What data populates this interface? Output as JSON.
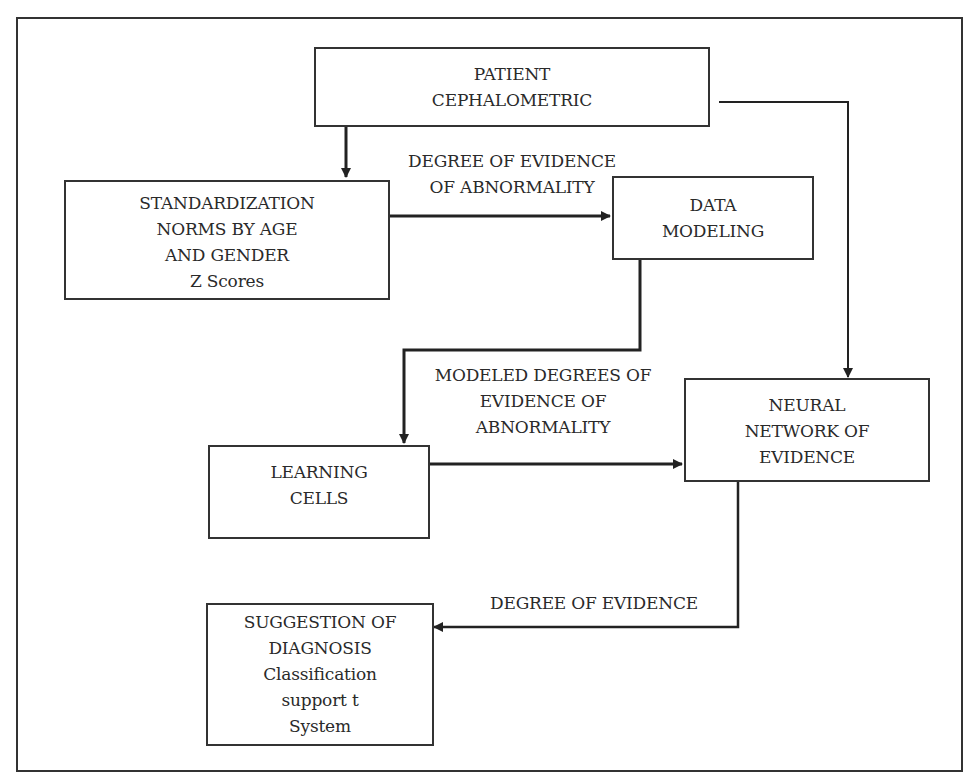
{
  "diagram": {
    "nodes": {
      "patient": {
        "lines": [
          "PATIENT",
          "CEPHALOMETRIC"
        ]
      },
      "standardization": {
        "lines": [
          "STANDARDIZATION",
          "NORMS BY AGE",
          "AND GENDER",
          "Z Scores"
        ]
      },
      "data_modeling": {
        "lines": [
          "DATA",
          "MODELING"
        ]
      },
      "learning_cells": {
        "lines": [
          "LEARNING",
          "CELLS"
        ]
      },
      "neural_network": {
        "lines": [
          "NEURAL",
          "NETWORK OF",
          "EVIDENCE"
        ]
      },
      "suggestion": {
        "lines": [
          "SUGGESTION OF",
          "DIAGNOSIS",
          "Classification",
          "support t",
          "System"
        ]
      }
    },
    "edge_labels": {
      "degree_abnormality": {
        "lines": [
          "DEGREE OF EVIDENCE",
          "OF ABNORMALITY"
        ]
      },
      "modeled_degrees": {
        "lines": [
          "MODELED DEGREES OF",
          "EVIDENCE  OF",
          "ABNORMALITY"
        ]
      },
      "degree_evidence": {
        "lines": [
          "DEGREE OF EVIDENCE"
        ]
      }
    },
    "edges": [
      {
        "from": "patient",
        "to": "standardization",
        "label": ""
      },
      {
        "from": "standardization",
        "to": "data_modeling",
        "label": "DEGREE OF EVIDENCE OF ABNORMALITY"
      },
      {
        "from": "patient",
        "to": "neural_network",
        "label": ""
      },
      {
        "from": "data_modeling",
        "to": "learning_cells",
        "label": "MODELED DEGREES OF EVIDENCE OF ABNORMALITY"
      },
      {
        "from": "learning_cells",
        "to": "neural_network",
        "label": ""
      },
      {
        "from": "neural_network",
        "to": "suggestion",
        "label": "DEGREE OF EVIDENCE"
      }
    ],
    "colors": {
      "line": "#333333",
      "text": "#2a2a2a",
      "background": "#ffffff"
    }
  }
}
